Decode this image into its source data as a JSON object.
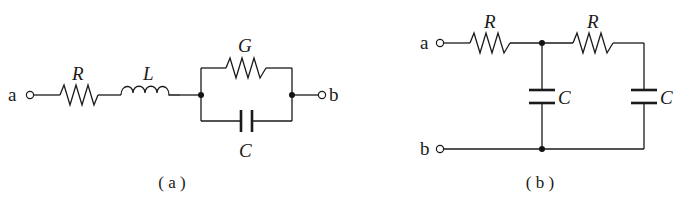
{
  "figure": {
    "panels": [
      {
        "id": "a",
        "caption": "( a )",
        "terminals": {
          "left": "a",
          "right": "b"
        },
        "components": {
          "series_resistor": "R",
          "series_inductor": "L",
          "parallel_conductance": "G",
          "parallel_capacitor": "C"
        },
        "topology": "a — R — L — (G ∥ C) — b"
      },
      {
        "id": "b",
        "caption": "( b )",
        "terminals": {
          "top": "a",
          "bottom": "b"
        },
        "components": {
          "resistor_1": "R",
          "resistor_2": "R",
          "capacitor_1": "C",
          "capacitor_2": "C"
        },
        "topology": "RC ladder: a — R — node — R — C to ground; node — C to ground; b is common"
      }
    ]
  }
}
